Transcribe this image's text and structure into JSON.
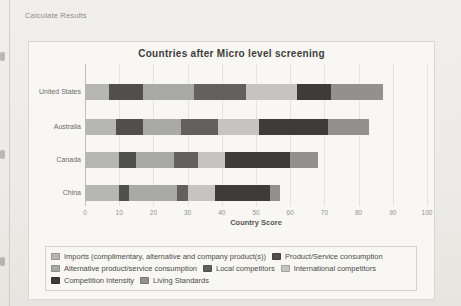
{
  "page": {
    "header_link": "Calculate Results"
  },
  "chart_data": {
    "type": "bar",
    "orientation": "horizontal",
    "stacked": true,
    "title": "Countries after Micro level screening",
    "xlabel": "Country Score",
    "xlim": [
      0,
      100
    ],
    "xticks": [
      0,
      10,
      20,
      30,
      40,
      50,
      60,
      70,
      80,
      90,
      100
    ],
    "grid": true,
    "legend_position": "bottom",
    "categories": [
      "United States",
      "Australia",
      "Canada",
      "China"
    ],
    "series": [
      {
        "name": "Imports (complimentary, alternative and company product(s))",
        "color": "#b6b6b2",
        "values": [
          7,
          9,
          10,
          10
        ]
      },
      {
        "name": "Product/Service consumption",
        "color": "#504f4d",
        "values": [
          10,
          8,
          5,
          3
        ]
      },
      {
        "name": "Alternative product/service consumption",
        "color": "#a9a9a5",
        "values": [
          15,
          11,
          11,
          14
        ]
      },
      {
        "name": "Local competitors",
        "color": "#62615f",
        "values": [
          15,
          11,
          7,
          3
        ]
      },
      {
        "name": "International competitors",
        "color": "#c5c4c1",
        "values": [
          15,
          12,
          8,
          8
        ]
      },
      {
        "name": "Competition Intensity",
        "color": "#3d3c3a",
        "values": [
          10,
          20,
          19,
          16
        ]
      },
      {
        "name": "Living Standards",
        "color": "#92918e",
        "values": [
          15,
          12,
          8,
          3
        ]
      }
    ]
  }
}
